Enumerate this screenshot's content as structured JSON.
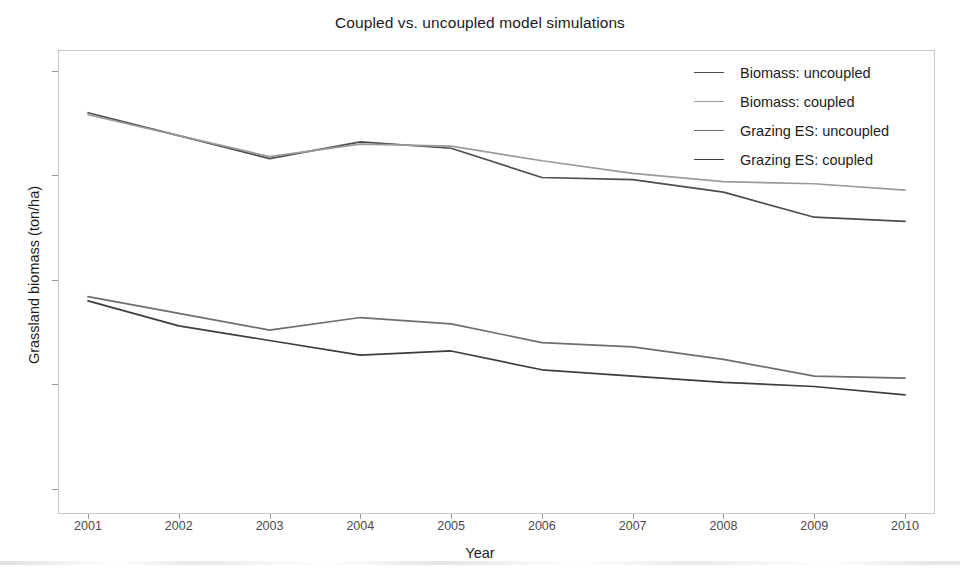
{
  "chart_data": {
    "type": "line",
    "title": "Coupled vs. uncoupled model simulations",
    "xlabel": "Year",
    "ylabel": "Grassland biomass (ton/ha)",
    "x": [
      2001,
      2002,
      2003,
      2004,
      2005,
      2006,
      2007,
      2008,
      2009,
      2010
    ],
    "xtick_labels": [
      "2001",
      "2002",
      "2003",
      "2004",
      "2005",
      "2006",
      "2007",
      "2008",
      "2009",
      "2010"
    ],
    "ytick_labels": [
      "2.0",
      "2.5",
      "3.0",
      "3.5",
      "4.0"
    ],
    "ytick_values": [
      2.0,
      2.5,
      3.0,
      3.5,
      4.0
    ],
    "xlim": [
      2001,
      2010
    ],
    "ylim": [
      1.88,
      4.1
    ],
    "grid": false,
    "legend_position": "top-right",
    "series": [
      {
        "name": "Biomass: uncoupled",
        "color": "#4d4d4d",
        "values": [
          3.8,
          3.69,
          3.58,
          3.66,
          3.63,
          3.49,
          3.48,
          3.42,
          3.3,
          3.28
        ]
      },
      {
        "name": "Biomass: coupled",
        "color": "#9a9a9a",
        "values": [
          3.79,
          3.69,
          3.59,
          3.65,
          3.64,
          3.57,
          3.51,
          3.47,
          3.46,
          3.43
        ]
      },
      {
        "name": "Grazing ES: uncoupled",
        "color": "#6e6e6e",
        "values": [
          2.92,
          2.84,
          2.76,
          2.82,
          2.79,
          2.7,
          2.68,
          2.62,
          2.54,
          2.53
        ]
      },
      {
        "name": "Grazing ES: coupled",
        "color": "#3d3d3d",
        "values": [
          2.9,
          2.78,
          2.71,
          2.64,
          2.66,
          2.57,
          2.54,
          2.51,
          2.49,
          2.45
        ]
      }
    ]
  },
  "legend": {
    "items": [
      {
        "label": "Biomass: uncoupled",
        "color": "#4d4d4d"
      },
      {
        "label": "Biomass: coupled",
        "color": "#9a9a9a"
      },
      {
        "label": "Grazing ES: uncoupled",
        "color": "#6e6e6e"
      },
      {
        "label": "Grazing ES: coupled",
        "color": "#3d3d3d"
      }
    ]
  },
  "colors": {
    "panel_border": "#c9c9c9",
    "tick": "#9a9a9a",
    "text": "#1c1c1c",
    "tick_text": "#4a4a4a"
  }
}
